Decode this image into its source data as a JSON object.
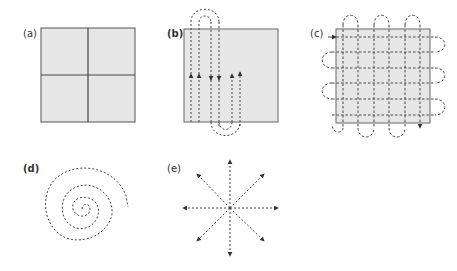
{
  "figure": {
    "colors": {
      "fill": "#e6e6e6",
      "stroke": "#555555",
      "dash": "#444444"
    },
    "panels": [
      {
        "id": "a",
        "label": "(a)",
        "pattern": "quadrant-grid"
      },
      {
        "id": "b",
        "label": "(b)",
        "pattern": "vertical-serpentine"
      },
      {
        "id": "c",
        "label": "(c)",
        "pattern": "raster-grid-serpentine"
      },
      {
        "id": "d",
        "label": "(d)",
        "pattern": "spiral"
      },
      {
        "id": "e",
        "label": "(e)",
        "pattern": "radial-star"
      }
    ]
  }
}
